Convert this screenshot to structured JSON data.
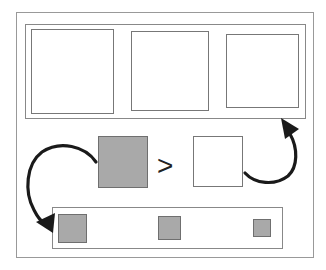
{
  "diagram": {
    "comparison_symbol": ">",
    "colors": {
      "frame_border": "#999999",
      "box_border": "#777777",
      "gray_fill": "#a9a9a9",
      "arrow": "#1a1a1a"
    },
    "top_panel": {
      "boxes": [
        {
          "fill": "white",
          "size": "large"
        },
        {
          "fill": "white",
          "size": "medium"
        },
        {
          "fill": "white",
          "size": "small"
        }
      ]
    },
    "middle": {
      "left_box": {
        "fill": "gray",
        "size": "large"
      },
      "right_box": {
        "fill": "white",
        "size": "large"
      }
    },
    "bottom_panel": {
      "boxes": [
        {
          "fill": "gray",
          "size": "large"
        },
        {
          "fill": "gray",
          "size": "medium"
        },
        {
          "fill": "gray",
          "size": "small"
        }
      ]
    },
    "arrows": [
      {
        "from": "gray-box",
        "to": "bottom-panel"
      },
      {
        "from": "white-box",
        "to": "top-panel"
      }
    ]
  }
}
